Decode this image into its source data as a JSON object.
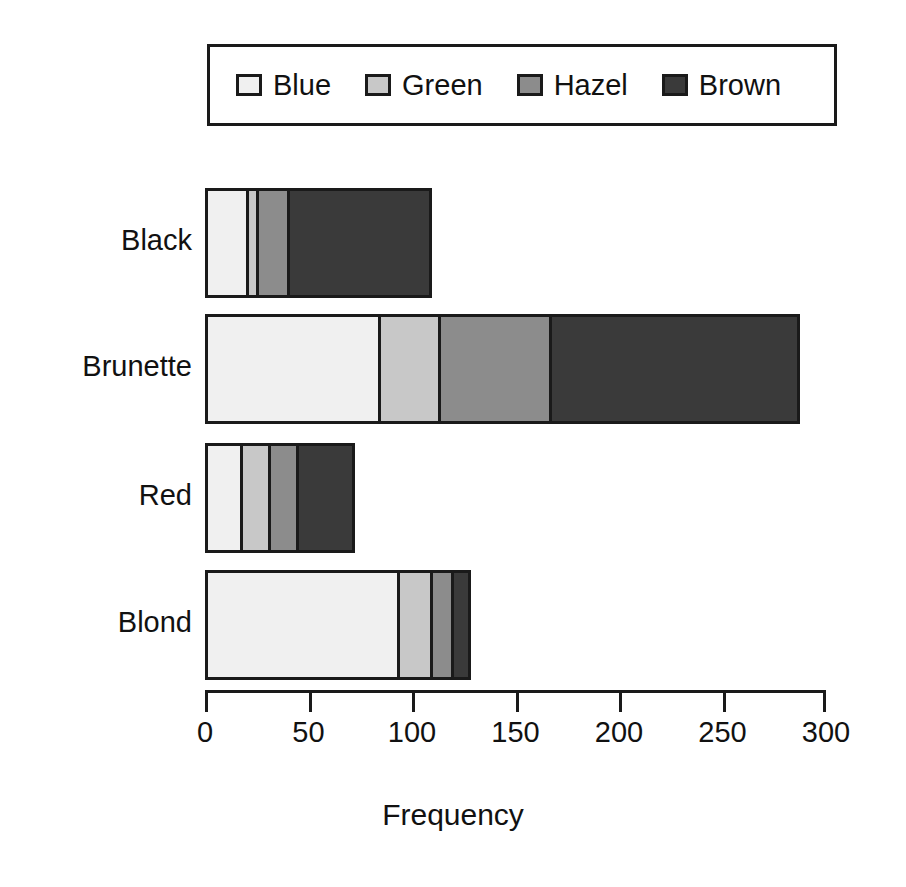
{
  "chart_data": {
    "type": "bar",
    "orientation": "horizontal",
    "stacked": true,
    "title": "",
    "xlabel": "Frequency",
    "ylabel": "",
    "xlim": [
      0,
      300
    ],
    "xticks": [
      0,
      50,
      100,
      150,
      200,
      250,
      300
    ],
    "xtick_labels": [
      "0",
      "50",
      "100",
      "150",
      "200",
      "250",
      "300"
    ],
    "grid": false,
    "legend_position": "top",
    "categories": [
      "Black",
      "Brunette",
      "Red",
      "Blond"
    ],
    "series": [
      {
        "name": "Blue",
        "color": "#f0f0f0",
        "values": [
          20,
          84,
          17,
          94
        ]
      },
      {
        "name": "Green",
        "color": "#c8c8c8",
        "values": [
          5,
          29,
          14,
          16
        ]
      },
      {
        "name": "Hazel",
        "color": "#8c8c8c",
        "values": [
          15,
          54,
          14,
          10
        ]
      },
      {
        "name": "Brown",
        "color": "#3a3a3a",
        "values": [
          68,
          119,
          26,
          7
        ]
      }
    ],
    "totals": [
      108,
      286,
      71,
      127
    ],
    "border_color": "#1a1a1a"
  },
  "legend": {
    "entries": [
      {
        "label": "Blue"
      },
      {
        "label": "Green"
      },
      {
        "label": "Hazel"
      },
      {
        "label": "Brown"
      }
    ]
  },
  "axis": {
    "title": "Frequency"
  }
}
